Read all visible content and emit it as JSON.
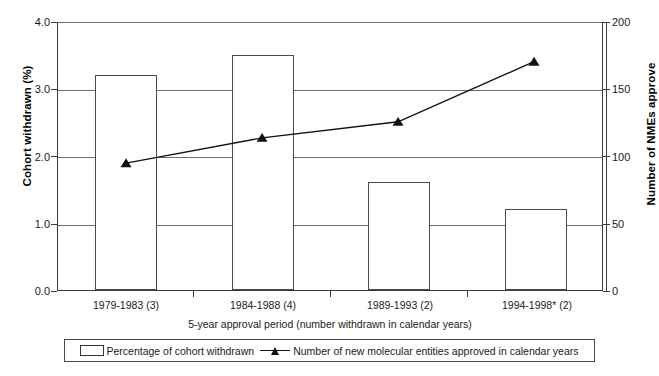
{
  "chart_data": {
    "type": "bar",
    "title": "",
    "categories": [
      "1979-1983 (3)",
      "1984-1988 (4)",
      "1989-1993 (2)",
      "1994-1998* (2)"
    ],
    "xlabel": "5-year approval period (number withdrawn in calendar years)",
    "ylabel": "Cohort withdrawn (%)",
    "ylabel_secondary": "Number of NMEs approve",
    "ylim": [
      0.0,
      4.0
    ],
    "ylim_secondary": [
      0,
      200
    ],
    "yticks": [
      "0.0",
      "1.0",
      "2.0",
      "3.0",
      "4.0"
    ],
    "ytick_values": [
      0.0,
      1.0,
      2.0,
      3.0,
      4.0
    ],
    "yticks_secondary": [
      "0",
      "50",
      "100",
      "150",
      "200"
    ],
    "ytick_values_secondary": [
      0,
      50,
      100,
      150,
      200
    ],
    "grid": true,
    "legend_position": "bottom",
    "series": [
      {
        "name": "Percentage of cohort withdrawn",
        "type": "bar",
        "axis": "left",
        "values": [
          3.2,
          3.5,
          1.6,
          1.2
        ]
      },
      {
        "name": "Number of new molecular entities approved in calendar years",
        "type": "line",
        "axis": "right",
        "marker": "triangle",
        "values": [
          95,
          114,
          126,
          171
        ]
      }
    ]
  },
  "legend": {
    "entries": [
      {
        "label": "Percentage of cohort withdrawn",
        "marker": "white-box"
      },
      {
        "label": "Number of new molecular entities approved in calendar years",
        "marker": "line-triangle"
      }
    ]
  },
  "colors": {
    "background": "#ffffff",
    "axis": "#3a3a3a",
    "grid": "#6f6f6f",
    "bar_fill": "#ffffff",
    "bar_edge": "#4a4a4a",
    "line": "#111111",
    "marker": "#111111",
    "text": "#1a1a1a"
  }
}
